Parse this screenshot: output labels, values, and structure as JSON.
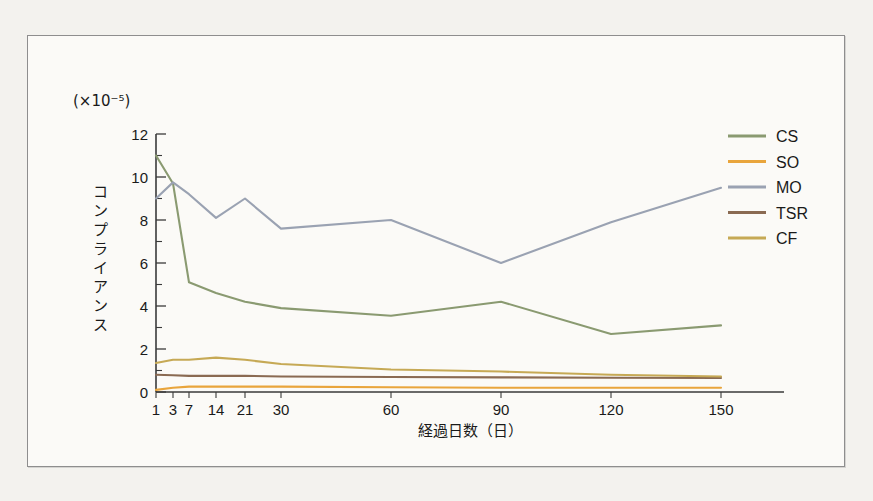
{
  "figure": {
    "background": "#fbfaf7",
    "page_background": "#f3f2ee",
    "border_color": "#8e8e8e"
  },
  "chart_data": {
    "type": "line",
    "title": "",
    "subtitle": "",
    "unit_note": "(×10⁻⁵)",
    "xlabel": "経過日数（日）",
    "ylabel": "コンプライアンス",
    "x": [
      1,
      3,
      7,
      14,
      21,
      30,
      60,
      90,
      120,
      150
    ],
    "xtick_labels": [
      "1",
      "3",
      "7",
      "14",
      "21",
      "30",
      "60",
      "90",
      "120",
      "150"
    ],
    "ytick_labels": [
      "0",
      "2",
      "4",
      "6",
      "8",
      "10",
      "12"
    ],
    "yticks": [
      0,
      2,
      4,
      6,
      8,
      10,
      12
    ],
    "ylim": [
      0,
      12
    ],
    "y_minor_step": 1,
    "grid": false,
    "legend_position": "top-right",
    "series": [
      {
        "name": "CS",
        "color": "#8a9a71",
        "values": [
          11.0,
          9.7,
          5.1,
          4.6,
          4.2,
          3.9,
          3.55,
          4.2,
          2.7,
          3.1
        ]
      },
      {
        "name": "SO",
        "color": "#e9a53c",
        "values": [
          0.1,
          0.2,
          0.25,
          0.25,
          0.25,
          0.25,
          0.22,
          0.2,
          0.2,
          0.2
        ]
      },
      {
        "name": "MO",
        "color": "#9aa2b2",
        "values": [
          9.0,
          9.75,
          9.2,
          8.1,
          9.0,
          7.6,
          8.0,
          6.0,
          7.9,
          9.5
        ]
      },
      {
        "name": "TSR",
        "color": "#8a6a52",
        "values": [
          0.8,
          0.78,
          0.75,
          0.75,
          0.75,
          0.72,
          0.7,
          0.68,
          0.66,
          0.65
        ]
      },
      {
        "name": "CF",
        "color": "#c6a955",
        "values": [
          1.35,
          1.5,
          1.5,
          1.6,
          1.5,
          1.3,
          1.05,
          0.95,
          0.8,
          0.72
        ]
      }
    ]
  },
  "legend": {
    "items": [
      {
        "label": "CS"
      },
      {
        "label": "SO"
      },
      {
        "label": "MO"
      },
      {
        "label": "TSR"
      },
      {
        "label": "CF"
      }
    ]
  }
}
